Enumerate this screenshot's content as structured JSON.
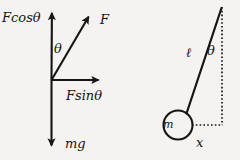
{
  "figure": {
    "background_color": "#f4f3f1",
    "ink_color": "#171412"
  },
  "force_diagram": {
    "name": "force-decomposition-diagram",
    "origin": {
      "x": 51,
      "y": 80
    },
    "labels": {
      "f_cos_theta": "Fcosθ",
      "f": "F",
      "theta": "θ",
      "f_sin_theta": "Fsinθ",
      "mg": "mg"
    },
    "vectors": [
      {
        "name": "F-cos-theta-vector",
        "label": "Fcosθ",
        "direction": "up",
        "from": [
          51,
          80
        ],
        "to": [
          52,
          6
        ]
      },
      {
        "name": "F-vector",
        "label": "F",
        "direction": "up-right",
        "from": [
          51,
          80
        ],
        "to": [
          92,
          10
        ]
      },
      {
        "name": "F-sin-theta-vector",
        "label": "Fsinθ",
        "direction": "right",
        "from": [
          51,
          80
        ],
        "to": [
          105,
          80
        ]
      },
      {
        "name": "mg-vector",
        "label": "mg",
        "direction": "down",
        "from": [
          51,
          80
        ],
        "to": [
          51,
          152
        ]
      }
    ],
    "angle": {
      "name": "theta-angle",
      "label": "θ",
      "between": [
        "F-cos-theta-vector",
        "F-vector"
      ]
    }
  },
  "pendulum_diagram": {
    "name": "pendulum-diagram",
    "pivot": {
      "x": 222,
      "y": 8
    },
    "bob": {
      "x": 178,
      "y": 125,
      "radius": 15,
      "label": "m"
    },
    "labels": {
      "length": "ℓ",
      "theta": "θ",
      "mass": "m",
      "displacement": "x"
    },
    "elements": [
      {
        "name": "pendulum-string",
        "label": "ℓ",
        "style": "solid",
        "from": [
          222,
          8
        ],
        "to": [
          186,
          114
        ]
      },
      {
        "name": "vertical-reference-line",
        "label": "",
        "style": "dotted",
        "from": [
          222,
          8
        ],
        "to": [
          222,
          125
        ]
      },
      {
        "name": "horizontal-reference-line",
        "label": "x",
        "style": "dotted",
        "from": [
          193,
          125
        ],
        "to": [
          222,
          125
        ]
      },
      {
        "name": "pendulum-angle",
        "label": "θ",
        "style": "label",
        "between": [
          "pendulum-string",
          "vertical-reference-line"
        ]
      }
    ]
  }
}
